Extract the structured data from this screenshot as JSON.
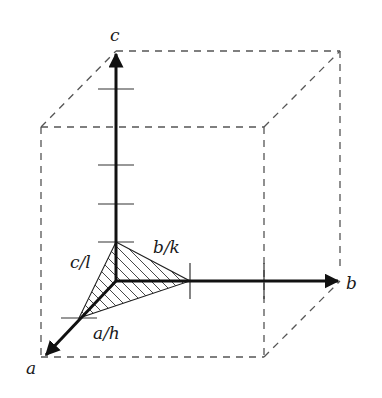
{
  "diagram": {
    "type": "crystal-axes-miller-plane",
    "axes": [
      {
        "name": "a",
        "label": "a"
      },
      {
        "name": "b",
        "label": "b"
      },
      {
        "name": "c",
        "label": "c"
      }
    ],
    "intercepts": [
      {
        "axis": "a",
        "label": "a/h"
      },
      {
        "axis": "b",
        "label": "b/k"
      },
      {
        "axis": "c",
        "label": "c/l"
      }
    ],
    "unit_cell": "dashed parallelepiped",
    "plane": "hatched triangular plane through the three intercepts"
  },
  "labels": {
    "axis_a": "a",
    "axis_b": "b",
    "axis_c": "c",
    "intercept_a": "a/h",
    "intercept_b": "b/k",
    "intercept_c": "c/l"
  },
  "colors": {
    "axis": "#111111",
    "dashed": "#555555",
    "background": "#ffffff"
  }
}
